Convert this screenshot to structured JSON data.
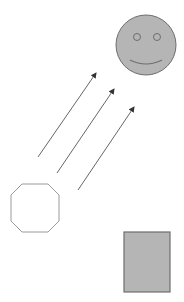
{
  "canvas": {
    "width": 184,
    "height": 302,
    "background": "#ffffff"
  },
  "colors": {
    "stroke": "#6e6e6e",
    "fill_gray": "#b5b5b5",
    "octagon_fill": "#ffffff",
    "arrow": "#555555"
  },
  "shapes": {
    "smiley": {
      "cx": 146,
      "cy": 45,
      "r": 30,
      "eyes": [
        {
          "cx": 137,
          "cy": 37,
          "r": 3.5
        },
        {
          "cx": 157,
          "cy": 37,
          "r": 3.5
        }
      ],
      "mouth": "M130,60 Q146,68 162,60"
    },
    "octagon": {
      "points": "22,184 48,184 59,195 59,221 48,232 22,232 11,221 11,195"
    },
    "rectangle": {
      "x": 124,
      "y": 232,
      "width": 46,
      "height": 60
    },
    "arrows": [
      {
        "x1": 38,
        "y1": 157,
        "x2": 96,
        "y2": 73
      },
      {
        "x1": 57,
        "y1": 173,
        "x2": 114,
        "y2": 89
      },
      {
        "x1": 78,
        "y1": 190,
        "x2": 134,
        "y2": 107
      }
    ]
  }
}
